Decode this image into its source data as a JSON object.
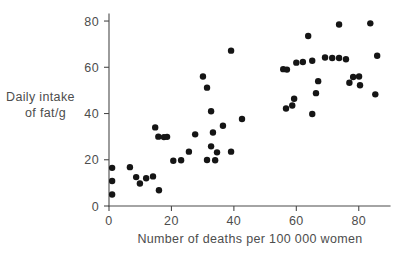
{
  "chart_data": {
    "type": "scatter",
    "title": "",
    "subtitle": "",
    "xlabel": "Number of deaths per 100 000 women",
    "ylabel_line1": "Daily intake",
    "ylabel_line2": "of fat/g",
    "ylabel": "Daily intake of fat/g",
    "xlim": [
      0,
      90
    ],
    "ylim": [
      0,
      88
    ],
    "xticks": [
      0,
      20,
      40,
      60,
      80
    ],
    "yticks": [
      0,
      20,
      40,
      60,
      80
    ],
    "xtick_labels": [
      "0",
      "20",
      "40",
      "60",
      "80"
    ],
    "ytick_labels": [
      "0",
      "20",
      "40",
      "60",
      "80"
    ],
    "grid": false,
    "legend": null,
    "legend_position": "none",
    "marker": {
      "shape": "circle",
      "color": "#151515",
      "radius_px": 3.2
    },
    "n_points": 53,
    "points": [
      {
        "x": 1.0,
        "y": 16.5
      },
      {
        "x": 1.0,
        "y": 10.8
      },
      {
        "x": 1.0,
        "y": 5.0
      },
      {
        "x": 6.7,
        "y": 16.8
      },
      {
        "x": 8.7,
        "y": 12.5
      },
      {
        "x": 9.9,
        "y": 9.7
      },
      {
        "x": 11.9,
        "y": 12.0
      },
      {
        "x": 14.1,
        "y": 12.8
      },
      {
        "x": 16.0,
        "y": 6.8
      },
      {
        "x": 14.8,
        "y": 34.0
      },
      {
        "x": 15.8,
        "y": 30.0
      },
      {
        "x": 17.6,
        "y": 29.8
      },
      {
        "x": 20.6,
        "y": 19.6
      },
      {
        "x": 25.6,
        "y": 23.5
      },
      {
        "x": 27.6,
        "y": 31.0
      },
      {
        "x": 30.1,
        "y": 56.0
      },
      {
        "x": 31.4,
        "y": 51.2
      },
      {
        "x": 31.4,
        "y": 19.9
      },
      {
        "x": 32.7,
        "y": 41.0
      },
      {
        "x": 32.7,
        "y": 25.8
      },
      {
        "x": 33.3,
        "y": 31.8
      },
      {
        "x": 34.6,
        "y": 23.2
      },
      {
        "x": 36.5,
        "y": 34.7
      },
      {
        "x": 39.1,
        "y": 23.5
      },
      {
        "x": 39.1,
        "y": 67.2
      },
      {
        "x": 42.6,
        "y": 37.6
      },
      {
        "x": 55.8,
        "y": 59.2
      },
      {
        "x": 56.7,
        "y": 42.2
      },
      {
        "x": 58.7,
        "y": 43.5
      },
      {
        "x": 59.3,
        "y": 46.4
      },
      {
        "x": 60.0,
        "y": 62.0
      },
      {
        "x": 63.8,
        "y": 73.5
      },
      {
        "x": 65.1,
        "y": 62.8
      },
      {
        "x": 65.1,
        "y": 39.8
      },
      {
        "x": 66.3,
        "y": 48.8
      },
      {
        "x": 67.0,
        "y": 54.0
      },
      {
        "x": 71.5,
        "y": 64.0
      },
      {
        "x": 73.7,
        "y": 64.0
      },
      {
        "x": 73.7,
        "y": 78.5
      },
      {
        "x": 75.9,
        "y": 63.5
      },
      {
        "x": 77.0,
        "y": 53.3
      },
      {
        "x": 78.2,
        "y": 55.8
      },
      {
        "x": 80.4,
        "y": 52.2
      },
      {
        "x": 83.7,
        "y": 79.0
      },
      {
        "x": 85.9,
        "y": 65.0
      },
      {
        "x": 85.3,
        "y": 48.3
      },
      {
        "x": 18.6,
        "y": 29.9
      },
      {
        "x": 23.1,
        "y": 19.8
      },
      {
        "x": 34.0,
        "y": 19.8
      },
      {
        "x": 69.2,
        "y": 64.2
      },
      {
        "x": 57.0,
        "y": 59.0
      },
      {
        "x": 62.1,
        "y": 62.3
      },
      {
        "x": 80.1,
        "y": 56.0
      }
    ]
  }
}
